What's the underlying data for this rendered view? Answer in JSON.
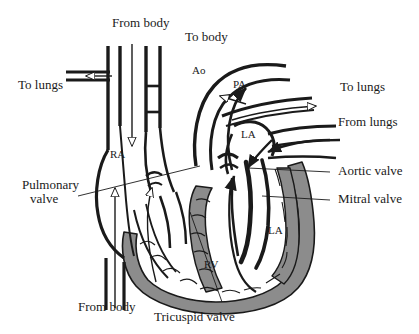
{
  "figure": {
    "background_color": "#ffffff",
    "ink_color": "#1a1a1a",
    "muscle_fill_color": "#8c8c8c",
    "vessel_fill_color": "#ffffff",
    "width": 419,
    "height": 334
  },
  "labels": {
    "from_body_top": "From body",
    "to_body": "To body",
    "to_lungs_left": "To lungs",
    "to_lungs_right": "To lungs",
    "from_lungs": "From lungs",
    "from_body_bottom": "From body",
    "pulmonary_valve_line1": "Pulmonary",
    "pulmonary_valve_line2": "valve",
    "tricuspid_valve": "Tricuspid valve",
    "aortic_valve": "Aortic valve",
    "mitral_valve": "Mitral valve"
  },
  "chambers": {
    "right_atrium": "RA",
    "right_ventricle": "RV",
    "left_atrium_upper": "LA",
    "left_atrium_lower": "LA"
  },
  "vessels": {
    "aorta": "Ao",
    "pulmonary_artery": "PA"
  },
  "flow_arrows": {
    "to_lungs_left": "hollow-arrow-left",
    "from_body_top": "hollow-arrow-down",
    "from_body_bottom": "hollow-arrow-up",
    "to_body": "solid-arrow-up",
    "to_lungs_right": "hollow-arrow-right",
    "from_lungs": "solid-arrow-left",
    "pa_outflow": "hollow-arrow-left",
    "rv_outflow": "hollow-arrow-up",
    "la_inflow": "solid-arrow-down",
    "lv_outflow": "solid-arrow-up"
  }
}
